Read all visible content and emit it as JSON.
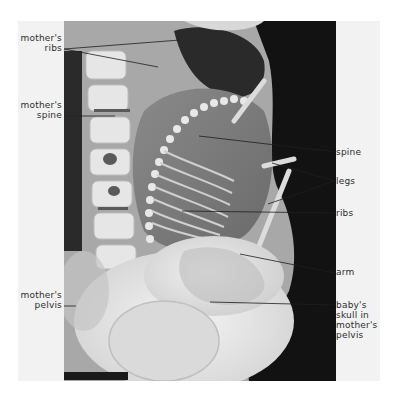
{
  "figure": {
    "left_labels": [
      {
        "id": "mothers-ribs",
        "line1": "mother's",
        "line2": "ribs"
      },
      {
        "id": "mothers-spine",
        "line1": "mother's",
        "line2": "spine"
      },
      {
        "id": "mothers-pelvis",
        "line1": "mother's",
        "line2": "pelvis"
      }
    ],
    "right_labels": [
      {
        "id": "spine",
        "text": "spine"
      },
      {
        "id": "legs",
        "text": "legs"
      },
      {
        "id": "ribs",
        "text": "ribs"
      },
      {
        "id": "arm",
        "text": "arm"
      },
      {
        "id": "babys-skull",
        "line1": "baby's",
        "line2": "skull in",
        "line3": "mother's",
        "line4": "pelvis"
      }
    ],
    "colors": {
      "label_text": "#2e2e2e",
      "leader_line": "#1e1e1e",
      "panel_bg": "#f2f2f2",
      "xray_dark": "#111111"
    }
  }
}
